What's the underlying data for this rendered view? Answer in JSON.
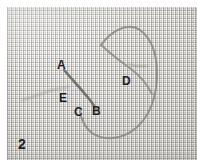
{
  "figure": {
    "number": "2",
    "kind": "embroidery-stitch-photograph",
    "background_color": "#e9e7e3",
    "thread_color": "#8b8780",
    "label_color": "#1a1a1a",
    "labels": [
      {
        "id": "A",
        "text": "A",
        "x": 57,
        "y": 59
      },
      {
        "id": "B",
        "text": "B",
        "x": 92,
        "y": 105
      },
      {
        "id": "C",
        "text": "C",
        "x": 74,
        "y": 106
      },
      {
        "id": "D",
        "text": "D",
        "x": 122,
        "y": 75
      },
      {
        "id": "E",
        "text": "E",
        "x": 59,
        "y": 92
      }
    ],
    "strands": [
      {
        "name": "diagonal-working-thread",
        "from": "A",
        "to": "B"
      },
      {
        "name": "left-tail-thread",
        "from": "E",
        "to": "left-edge"
      },
      {
        "name": "loop-thread",
        "from": "B",
        "to": "D"
      }
    ]
  }
}
